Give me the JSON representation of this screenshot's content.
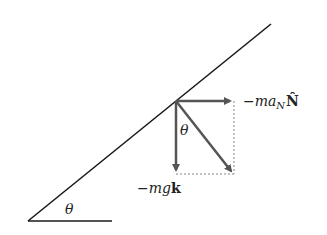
{
  "diagram": {
    "labels": {
      "incline_angle": "θ",
      "vector_angle": "θ",
      "normal_force_prefix": "−ma",
      "normal_force_sub": "N",
      "normal_force_vec": "N̂",
      "gravity_prefix": "−mg",
      "gravity_vec": "k"
    },
    "colors": {
      "incline": "#1a1a1a",
      "vectors": "#555555",
      "dashed": "#888888"
    }
  }
}
